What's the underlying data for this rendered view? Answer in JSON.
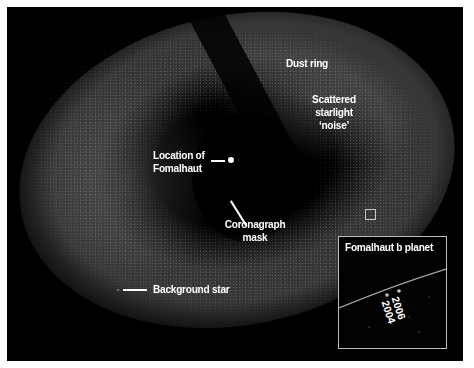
{
  "image": {
    "subject": "Hubble coronagraph image of the Fomalhaut dust ring",
    "background_color": "#000000",
    "page_color": "#ffffff",
    "label_color": "#ffffff"
  },
  "labels": {
    "dust_ring": "Dust ring",
    "scattered_line1": "Scattered",
    "scattered_line2": "starlight",
    "scattered_line3": "‘noise’",
    "location_line1": "Location of",
    "location_line2": "Fomalhaut",
    "coronagraph_line1": "Coronagraph",
    "coronagraph_line2": "mask",
    "background_star": "Background star"
  },
  "inset": {
    "title": "Fomalhaut b planet",
    "year_1": "2006",
    "year_2": "2004"
  }
}
